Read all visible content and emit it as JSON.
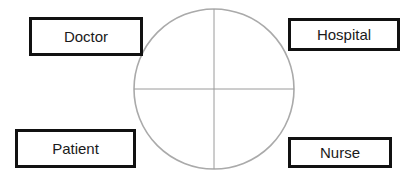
{
  "diagram": {
    "type": "quadrant-circle-with-labels",
    "circle": {
      "stroke_color": "#aaaaaa",
      "quadrants": 4,
      "quadrant_contents": [
        "",
        "",
        "",
        ""
      ]
    },
    "labels": {
      "top_left": "Doctor",
      "top_right": "Hospital",
      "bottom_left": "Patient",
      "bottom_right": "Nurse"
    },
    "box_border_color": "#111111",
    "text_color": "#1a1a1a",
    "background_color": "#ffffff"
  }
}
